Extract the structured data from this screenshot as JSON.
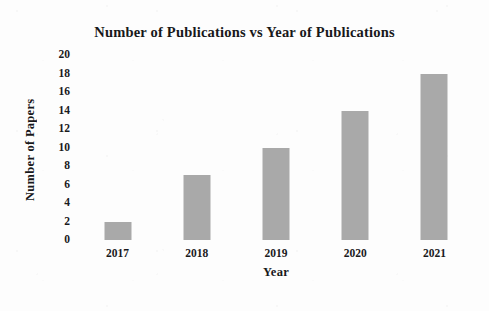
{
  "chart_data": {
    "type": "bar",
    "title": "Number of Publications vs Year of Publications",
    "xlabel": "Year",
    "ylabel": "Number of Papers",
    "categories": [
      "2017",
      "2018",
      "2019",
      "2020",
      "2021"
    ],
    "values": [
      2,
      7,
      10,
      14,
      18
    ],
    "ylim": [
      0,
      20
    ],
    "ytick_step": 2,
    "yticks": [
      20,
      18,
      16,
      14,
      12,
      10,
      8,
      6,
      4,
      2,
      0
    ],
    "grid": false,
    "legend": null,
    "bar_color": "#a9a9a9",
    "background_color": "#fdfdfd",
    "text_color": "#18181a"
  }
}
